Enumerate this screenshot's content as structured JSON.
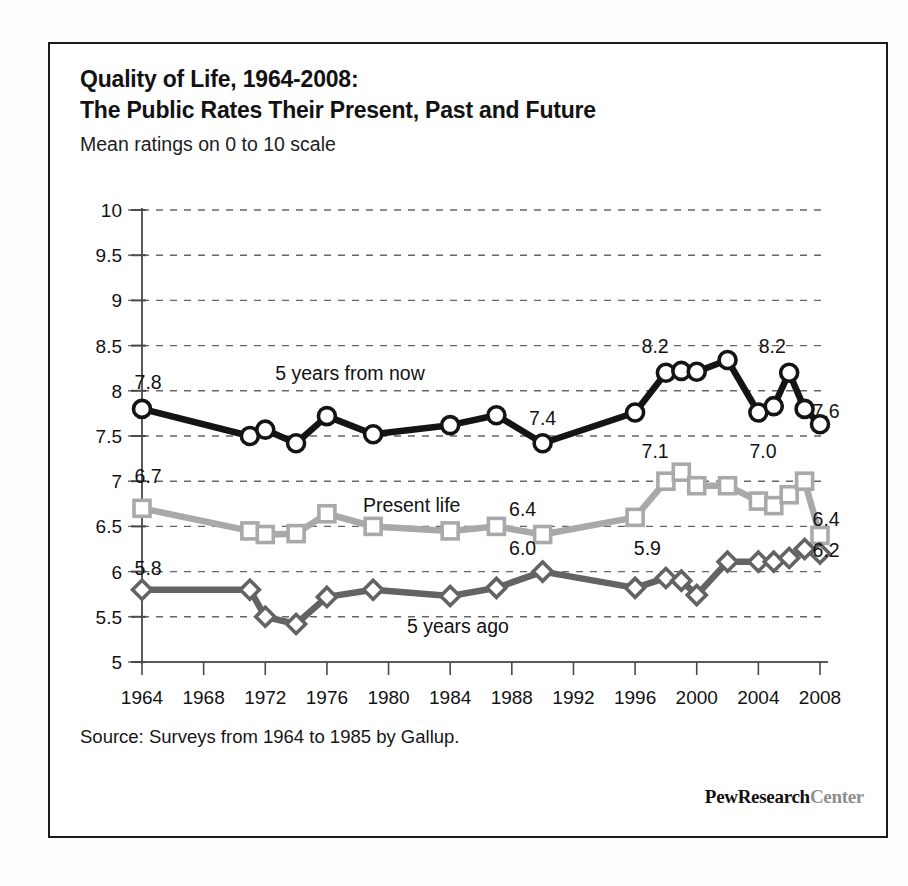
{
  "title": {
    "line1": "Quality of Life, 1964-2008:",
    "line2": "The Public Rates Their Present, Past and Future",
    "subtitle": "Mean ratings on 0 to 10 scale"
  },
  "footer": {
    "source": "Source: Surveys from 1964 to 1985 by Gallup.",
    "brand_dark_1": "Pew",
    "brand_dark_2": "Research",
    "brand_light": "Center"
  },
  "chart_data": {
    "type": "line",
    "title": "Quality of Life, 1964-2008: The Public Rates Their Present, Past and Future",
    "subtitle": "Mean ratings on 0 to 10 scale",
    "xlabel": "",
    "ylabel": "",
    "xlim": [
      1964,
      2008
    ],
    "ylim": [
      5,
      10
    ],
    "ytick_values": [
      5,
      5.5,
      6,
      6.5,
      7,
      7.5,
      8,
      8.5,
      9,
      9.5,
      10
    ],
    "ytick_labels": [
      "5",
      "5.5",
      "6",
      "6.5",
      "7",
      "7.5",
      "8",
      "8.5",
      "9",
      "9.5",
      "10"
    ],
    "xtick_values": [
      1964,
      1968,
      1972,
      1976,
      1980,
      1984,
      1988,
      1992,
      1996,
      2000,
      2004,
      2008
    ],
    "xtick_labels": [
      "1964",
      "1968",
      "1972",
      "1976",
      "1980",
      "1984",
      "1988",
      "1992",
      "1996",
      "2000",
      "2004",
      "2008"
    ],
    "grid": "horizontal-dashed",
    "legend": "inline-annotations",
    "series": [
      {
        "name": "5 years from now",
        "color": "#141414",
        "marker": "circle",
        "x": [
          1964,
          1971,
          1972,
          1974,
          1976,
          1979,
          1984,
          1987,
          1990,
          1996,
          1998,
          1999,
          2000,
          2002,
          2004,
          2005,
          2006,
          2007,
          2008
        ],
        "values": [
          7.8,
          7.5,
          7.57,
          7.42,
          7.72,
          7.52,
          7.62,
          7.73,
          7.42,
          7.76,
          8.2,
          8.22,
          8.21,
          8.34,
          7.76,
          7.83,
          8.2,
          7.8,
          7.63
        ]
      },
      {
        "name": "Present life",
        "color": "#a9a9a9",
        "marker": "square",
        "x": [
          1964,
          1971,
          1972,
          1974,
          1976,
          1979,
          1984,
          1987,
          1990,
          1996,
          1998,
          1999,
          2000,
          2002,
          2004,
          2005,
          2006,
          2007,
          2008
        ],
        "values": [
          6.7,
          6.45,
          6.41,
          6.42,
          6.64,
          6.5,
          6.45,
          6.5,
          6.41,
          6.6,
          7.0,
          7.1,
          6.95,
          6.95,
          6.78,
          6.73,
          6.85,
          7.0,
          6.4
        ]
      },
      {
        "name": "5 years ago",
        "color": "#636363",
        "marker": "diamond",
        "x": [
          1964,
          1971,
          1972,
          1974,
          1976,
          1979,
          1984,
          1987,
          1990,
          1996,
          1998,
          1999,
          2000,
          2002,
          2004,
          2005,
          2006,
          2007,
          2008
        ],
        "values": [
          5.8,
          5.8,
          5.5,
          5.42,
          5.72,
          5.8,
          5.73,
          5.82,
          6.0,
          5.82,
          5.93,
          5.9,
          5.74,
          6.11,
          6.11,
          6.11,
          6.15,
          6.25,
          6.2
        ]
      }
    ],
    "series_annotations": [
      {
        "text": "5 years from now",
        "x": 1977.5,
        "y": 8.12
      },
      {
        "text": "Present life",
        "x": 1981.5,
        "y": 6.66
      },
      {
        "text": "5 years ago",
        "x": 1984.5,
        "y": 5.32
      }
    ],
    "point_labels": [
      {
        "series": "5 years from now",
        "text": "7.8",
        "x": 1964.4,
        "y": 8.02
      },
      {
        "series": "5 years from now",
        "text": "7.4",
        "x": 1990.0,
        "y": 7.62
      },
      {
        "series": "5 years from now",
        "text": "8.2",
        "x": 1997.3,
        "y": 8.42
      },
      {
        "series": "5 years from now",
        "text": "8.2",
        "x": 2004.9,
        "y": 8.42
      },
      {
        "series": "5 years from now",
        "text": "7.6",
        "x": 2008.4,
        "y": 7.7
      },
      {
        "series": "Present life",
        "text": "6.7",
        "x": 1964.4,
        "y": 6.98
      },
      {
        "series": "Present life",
        "text": "6.4",
        "x": 1988.7,
        "y": 6.62
      },
      {
        "series": "Present life",
        "text": "7.1",
        "x": 1997.3,
        "y": 7.26
      },
      {
        "series": "Present life",
        "text": "7.0",
        "x": 2004.3,
        "y": 7.26
      },
      {
        "series": "Present life",
        "text": "6.4",
        "x": 2008.4,
        "y": 6.5
      },
      {
        "series": "5 years ago",
        "text": "5.8",
        "x": 1964.4,
        "y": 5.96
      },
      {
        "series": "5 years ago",
        "text": "6.0",
        "x": 1988.7,
        "y": 6.18
      },
      {
        "series": "5 years ago",
        "text": "5.9",
        "x": 1996.8,
        "y": 6.18
      },
      {
        "series": "5 years ago",
        "text": "6.2",
        "x": 2008.4,
        "y": 6.16
      }
    ]
  }
}
